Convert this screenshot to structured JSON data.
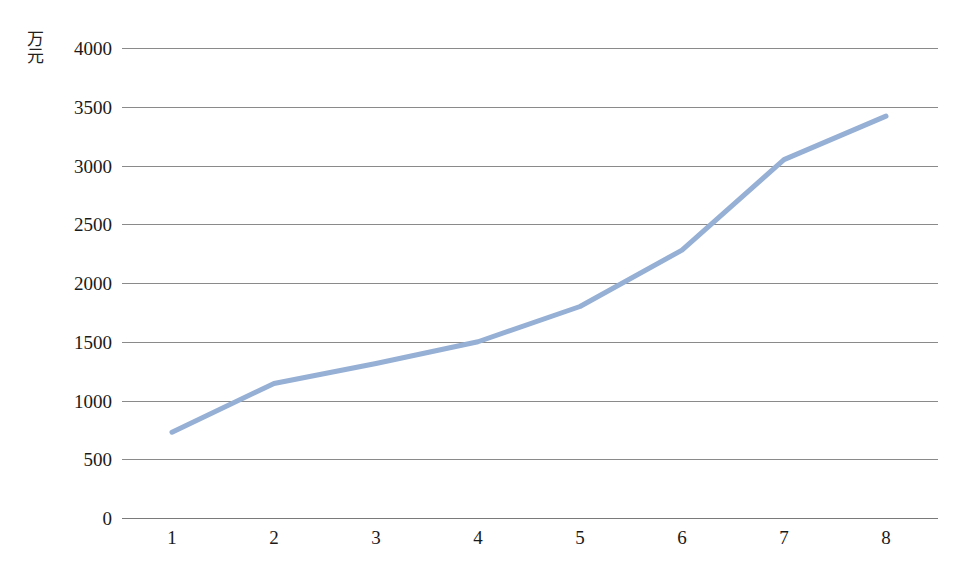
{
  "chart_data": {
    "type": "line",
    "title": "",
    "subtitle": "",
    "xlabel": "",
    "ylabel": "万元",
    "categories": [
      "1",
      "2",
      "3",
      "4",
      "5",
      "6",
      "7",
      "8"
    ],
    "values": [
      730,
      1145,
      1315,
      1500,
      1800,
      2280,
      3050,
      3420
    ],
    "series": [
      {
        "name": "",
        "values": [
          730,
          1145,
          1315,
          1500,
          1800,
          2280,
          3050,
          3420
        ],
        "color": "#95AFD5"
      }
    ],
    "ylim": [
      0,
      4000
    ],
    "yticks": [
      0,
      500,
      1000,
      1500,
      2000,
      2500,
      3000,
      3500,
      4000
    ],
    "ytick_labels": [
      "0",
      "500",
      "1000",
      "1500",
      "2000",
      "2500",
      "3000",
      "3500",
      "4000"
    ],
    "xticks": [
      "1",
      "2",
      "3",
      "4",
      "5",
      "6",
      "7",
      "8"
    ],
    "grid": {
      "horizontal": true,
      "vertical": false,
      "color": "#8a8a8a"
    },
    "legend": {
      "visible": false,
      "position": "none",
      "entries": []
    },
    "markers": false,
    "line_width": 5,
    "background_color": "#ffffff"
  }
}
